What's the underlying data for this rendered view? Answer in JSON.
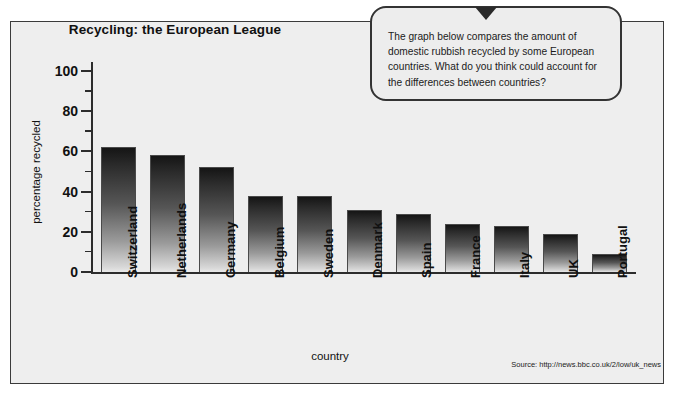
{
  "panel": {
    "background_color": "#eeeeee",
    "border_color": "#3b3b3b"
  },
  "chart_data": {
    "type": "bar",
    "title": "Recycling: the European League",
    "xlabel": "country",
    "ylabel": "percentage recycled",
    "ylim": [
      0,
      100
    ],
    "ytick_labels": [
      "0",
      "20",
      "40",
      "60",
      "80",
      "100"
    ],
    "ytick_values": [
      0,
      20,
      40,
      60,
      80,
      100
    ],
    "minor_tick_step": 10,
    "grid": false,
    "legend": false,
    "categories": [
      "Switzerland",
      "Netherlands",
      "Germany",
      "Belgium",
      "Sweden",
      "Denmark",
      "Spain",
      "France",
      "Italy",
      "UK",
      "Portugal"
    ],
    "values": [
      62,
      58,
      52,
      38,
      38,
      31,
      29,
      24,
      23,
      19,
      9
    ],
    "bar_gradient": [
      "#151515",
      "#e8e8e8"
    ],
    "source": "Source: http://news.bbc.co.uk/2/low/uk_news"
  },
  "bubble": {
    "text": "The graph below compares the amount of domestic rubbish recycled by some European countries. What do you think could account for the differences between countries?"
  }
}
